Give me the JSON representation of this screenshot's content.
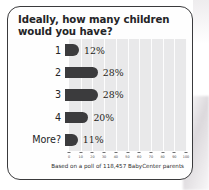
{
  "card": {
    "title": "Ideally, how many children would you have?"
  },
  "chart_data": {
    "type": "bar",
    "orientation": "horizontal",
    "title": "Ideally, how many children would you have?",
    "xlabel": "",
    "ylabel": "",
    "categories": [
      "1",
      "2",
      "3",
      "4",
      "More?"
    ],
    "values": [
      12,
      28,
      28,
      20,
      11
    ],
    "data_labels": [
      "12%",
      "28%",
      "28%",
      "20%",
      "11%"
    ],
    "xlim": [
      0,
      100
    ],
    "xticks": [
      0,
      10,
      20,
      30,
      40,
      50,
      60,
      70,
      80,
      90,
      100
    ],
    "xtick_labels": [
      "0",
      "10",
      "20",
      "30",
      "40",
      "50",
      "60",
      "70",
      "80",
      "90",
      "100"
    ],
    "grid": true,
    "legend": false,
    "bar_color": "#3b3b3d",
    "plot_background": "#e9e9ea",
    "annotation": "Based on a poll of 118,457 BabyCenter parents"
  },
  "footer": {
    "source": "Based on a poll of 118,457 BabyCenter parents"
  }
}
